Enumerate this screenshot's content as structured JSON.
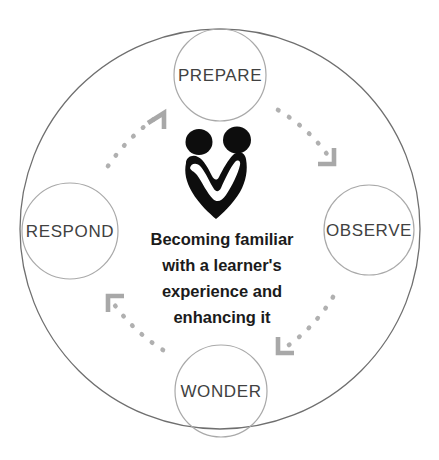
{
  "diagram": {
    "title": "Becoming familiar with a learner's experience and enhancing it",
    "type": "cycle",
    "colors": {
      "outer_ring_stroke": "#6f6f6f",
      "node_circle_stroke": "#a9a9a9",
      "node_label_color": "#414141",
      "center_text_color": "#1b1b1b",
      "arrow_color": "#a8a8a8",
      "logo_color": "#0d0d0d",
      "background": "#ffffff"
    },
    "outer_ring": {
      "name": "outer-ring",
      "cx": 220,
      "cy": 229,
      "r": 200
    },
    "center": {
      "logo_name": "two-people-heart-logo",
      "lines": [
        "Becoming familiar",
        "with a learner's",
        "experience and",
        "enhancing it"
      ]
    },
    "nodes": [
      {
        "id": "prepare",
        "label": "PREPARE",
        "cx": 220,
        "cy": 75,
        "r": 46,
        "position": "top"
      },
      {
        "id": "observe",
        "label": "OBSERVE",
        "cx": 369,
        "cy": 230,
        "r": 45,
        "position": "right"
      },
      {
        "id": "wonder",
        "label": "WONDER",
        "cx": 221,
        "cy": 391,
        "r": 46,
        "position": "bottom"
      },
      {
        "id": "respond",
        "label": "RESPOND",
        "cx": 70,
        "cy": 231,
        "r": 48,
        "position": "left"
      }
    ],
    "connectors": [
      {
        "id": "respond-to-prepare",
        "from": "respond",
        "to": "prepare",
        "style": "dotted",
        "arrow": "corner-bracket",
        "direction": "up-right"
      },
      {
        "id": "prepare-to-observe",
        "from": "prepare",
        "to": "observe",
        "style": "dotted",
        "arrow": "corner-bracket",
        "direction": "down-right"
      },
      {
        "id": "observe-to-wonder",
        "from": "observe",
        "to": "wonder",
        "style": "dotted",
        "arrow": "corner-bracket",
        "direction": "down-left"
      },
      {
        "id": "wonder-to-respond",
        "from": "wonder",
        "to": "respond",
        "style": "dotted",
        "arrow": "corner-bracket",
        "direction": "up-left"
      }
    ]
  }
}
